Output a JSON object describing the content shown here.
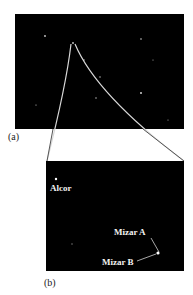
{
  "figure": {
    "panel_a": {
      "label": "(a)"
    },
    "panel_b": {
      "label": "(b)",
      "stars": [
        {
          "name": "Alcor",
          "label": "Alcor"
        },
        {
          "name": "Mizar A",
          "label": "Mizar A"
        },
        {
          "name": "Mizar B",
          "label": "Mizar B"
        }
      ]
    },
    "colors": {
      "sky": "#000000",
      "connector": "#d8d8d8",
      "star": "#ffffff",
      "label_text": "#f2f2f2"
    }
  }
}
